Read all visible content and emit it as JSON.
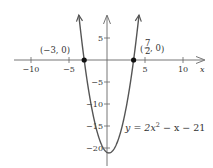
{
  "chart_data": {
    "type": "line",
    "title": "",
    "equation": "y = 2x² − x − 21",
    "equation_parts": {
      "prefix": "y = 2x",
      "exponent": "2",
      "suffix": " − x − 21"
    },
    "xlabel": "x",
    "ylabel": "",
    "xlim": [
      -11,
      13
    ],
    "ylim": [
      -22,
      10
    ],
    "x_ticks": [
      -10,
      -5,
      5,
      10
    ],
    "x_tick_labels": [
      "−10",
      "−5",
      "5",
      "10"
    ],
    "y_ticks": [
      5,
      -5,
      -10,
      -15,
      -20
    ],
    "y_tick_labels": [
      "5",
      "−5",
      "−10",
      "−15",
      "−20"
    ],
    "grid": false,
    "legend": null,
    "series": [
      {
        "name": "y = 2x^2 - x - 21",
        "coefficients": {
          "a": 2,
          "b": -1,
          "c": -21
        },
        "x": [
          -4.0,
          -3.5,
          -3.0,
          -2.5,
          -2.0,
          -1.5,
          -1.0,
          -0.5,
          0.0,
          0.25,
          0.5,
          1.0,
          1.5,
          2.0,
          2.5,
          3.0,
          3.5,
          4.0,
          4.5
        ],
        "y": [
          15.0,
          6.0,
          0.0,
          -6.0,
          -11.0,
          -15.0,
          -18.0,
          -20.0,
          -21.0,
          -21.125,
          -21.0,
          -20.0,
          -18.0,
          -15.0,
          -11.0,
          -6.0,
          0.0,
          7.0,
          15.0
        ],
        "color": "#555555"
      }
    ],
    "points": [
      {
        "x": -3,
        "y": 0,
        "label": "(−3, 0)"
      },
      {
        "x": 3.5,
        "y": 0,
        "label_num": "7",
        "label_den": "2",
        "label_suffix": ", 0"
      }
    ],
    "vertex": {
      "x": 0.25,
      "y": -21.125
    }
  }
}
